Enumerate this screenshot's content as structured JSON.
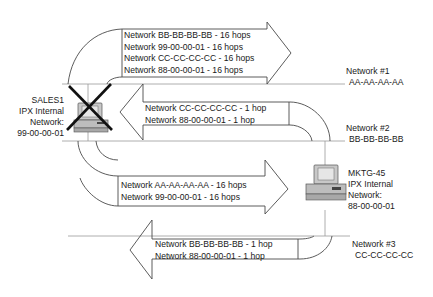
{
  "diagram": {
    "colors": {
      "line": "#4a4a4a",
      "network_line": "#9a9a9a",
      "text": "#1a1a1a",
      "cross": "#111111",
      "computer_body": "#c8c8c8"
    },
    "networks": [
      {
        "name": "Network #1",
        "address": "AA-AA-AA-AA"
      },
      {
        "name": "Network #2",
        "address": "BB-BB-BB-BB"
      },
      {
        "name": "Network #3",
        "address": "CC-CC-CC-CC"
      }
    ],
    "nodes": {
      "sales1": {
        "name": "SALES1",
        "line2": "IPX Internal",
        "line3": "Network:",
        "address": "99-00-00-01",
        "status": "failed",
        "icon": "computer-icon-crossed"
      },
      "mktg45": {
        "name": "MKTG-45",
        "line2": "IPX Internal",
        "line3": "Network:",
        "address": "88-00-00-01",
        "icon": "computer-icon"
      }
    },
    "arrows": [
      {
        "direction": "right",
        "from": "SALES1",
        "to": "Network #1",
        "routes": [
          "Network BB-BB-BB-BB - 16 hops",
          "Network 99-00-00-01 - 16 hops",
          "Network CC-CC-CC-CC - 16 hops",
          "Network 88-00-00-01 - 16 hops"
        ]
      },
      {
        "direction": "left",
        "from": "Network #2",
        "to": "SALES1",
        "routes": [
          "Network CC-CC-CC-CC - 1 hop",
          "Network 88-00-00-01 - 1 hop"
        ]
      },
      {
        "direction": "right",
        "from": "SALES1",
        "to": "MKTG-45",
        "routes": [
          "Network AA-AA-AA-AA - 16 hops",
          "Network 99-00-00-01 - 16 hops"
        ]
      },
      {
        "direction": "left",
        "from": "MKTG-45",
        "to": "Network #3",
        "routes": [
          "Network BB-BB-BB-BB - 1 hop",
          "Network 88-00-00-01 - 1 hop"
        ]
      }
    ]
  }
}
